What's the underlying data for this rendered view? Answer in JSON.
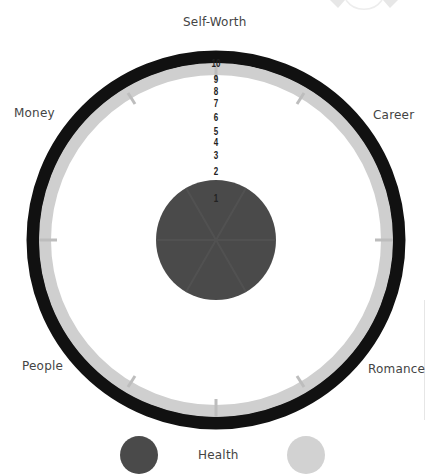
{
  "wheel": {
    "center": [
      216,
      240
    ],
    "outer_ring_color": "#111111",
    "inner_ring_color": "#cfcfcf",
    "fill_color": "#4a4a4a",
    "fill_level": 2,
    "max_level": 10
  },
  "categories": {
    "self_worth": "Self-Worth",
    "career": "Career",
    "romance": "Romance",
    "health": "Health",
    "people": "People",
    "money": "Money"
  },
  "scale": [
    "10",
    "9",
    "8",
    "7",
    "6",
    "5",
    "4",
    "3",
    "2",
    "1"
  ],
  "legend": {
    "dark_color": "#4a4a4a",
    "light_color": "#cfcfcf"
  }
}
